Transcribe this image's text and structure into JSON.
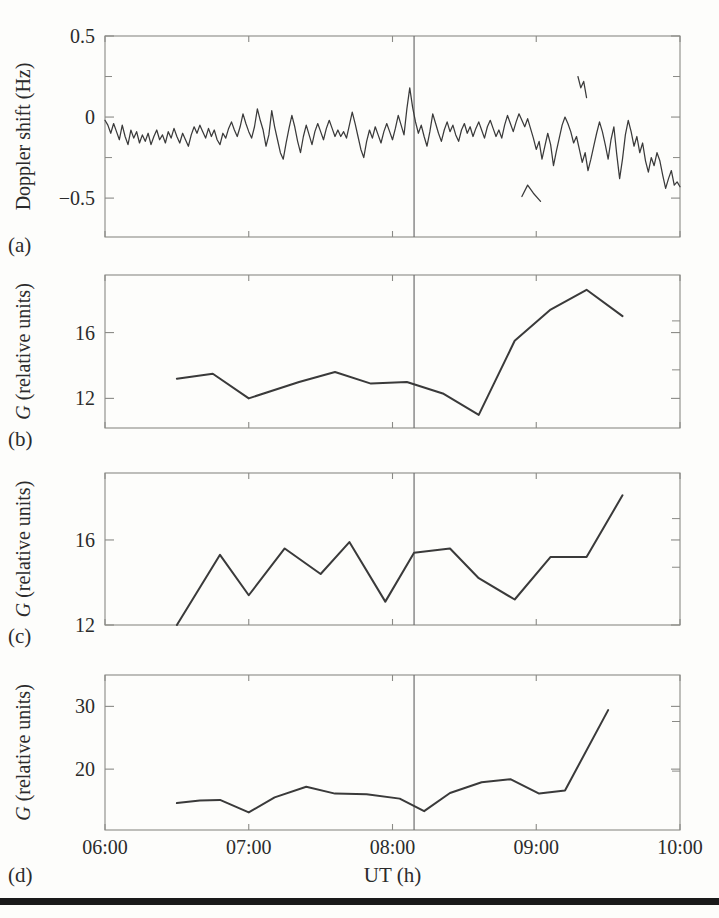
{
  "figure": {
    "panel_labels": [
      "(a)",
      "(b)",
      "(c)",
      "(d)"
    ],
    "xlabel": "UT (h)",
    "xticklabels": [
      "06:00",
      "07:00",
      "08:00",
      "09:00",
      "10:00"
    ],
    "event_marker_label": "08:09",
    "line_color": "#3a3a3a",
    "axis_color": "#8a8a86",
    "marker_color": "#6e6e6e",
    "rule_color": "#1a1a1a"
  },
  "chart_data": [
    {
      "id": "panel-a",
      "panel": "(a)",
      "type": "line",
      "title": "",
      "xlabel": "",
      "ylabel": "Doppler shift (Hz)",
      "xlim": [
        6.0,
        10.0
      ],
      "ylim": [
        -0.74,
        0.5
      ],
      "yticks": [
        0.5,
        0,
        -0.5
      ],
      "yticklabels": [
        "0.5",
        "0",
        "−0.5"
      ],
      "minor_yticks": [
        0.25,
        -0.25
      ],
      "xticks": [
        6,
        7,
        8,
        9,
        10
      ],
      "grid": false,
      "vline": 8.15,
      "series": [
        {
          "name": "doppler-main",
          "x": [
            6.0,
            6.02,
            6.04,
            6.06,
            6.08,
            6.1,
            6.12,
            6.14,
            6.16,
            6.18,
            6.2,
            6.22,
            6.24,
            6.26,
            6.28,
            6.3,
            6.32,
            6.34,
            6.36,
            6.38,
            6.4,
            6.42,
            6.44,
            6.46,
            6.48,
            6.5,
            6.52,
            6.54,
            6.56,
            6.58,
            6.6,
            6.62,
            6.64,
            6.66,
            6.68,
            6.7,
            6.72,
            6.74,
            6.76,
            6.78,
            6.8,
            6.82,
            6.84,
            6.86,
            6.88,
            6.9,
            6.92,
            6.94,
            6.96,
            6.98,
            7.0,
            7.02,
            7.04,
            7.06,
            7.08,
            7.1,
            7.12,
            7.14,
            7.16,
            7.18,
            7.2,
            7.22,
            7.24,
            7.26,
            7.28,
            7.3,
            7.32,
            7.34,
            7.36,
            7.38,
            7.4,
            7.42,
            7.44,
            7.46,
            7.48,
            7.5,
            7.52,
            7.54,
            7.56,
            7.58,
            7.6,
            7.62,
            7.64,
            7.66,
            7.68,
            7.7,
            7.72,
            7.74,
            7.76,
            7.78,
            7.8,
            7.82,
            7.84,
            7.86,
            7.88,
            7.9,
            7.92,
            7.94,
            7.96,
            7.98,
            8.0,
            8.02,
            8.04,
            8.06,
            8.08,
            8.1,
            8.12,
            8.14,
            8.16,
            8.18,
            8.2,
            8.22,
            8.24,
            8.26,
            8.28,
            8.3,
            8.32,
            8.34,
            8.36,
            8.38,
            8.4,
            8.42,
            8.44,
            8.46,
            8.48,
            8.5,
            8.52,
            8.54,
            8.56,
            8.58,
            8.6,
            8.62,
            8.64,
            8.66,
            8.68,
            8.7,
            8.72,
            8.74,
            8.76,
            8.78,
            8.8,
            8.82,
            8.84,
            8.86,
            8.88,
            8.9,
            8.92,
            8.94,
            8.96,
            8.98,
            9.0,
            9.02,
            9.04,
            9.06,
            9.08,
            9.1,
            9.12,
            9.14,
            9.16,
            9.18,
            9.2,
            9.22,
            9.24,
            9.26,
            9.28,
            9.3,
            9.32,
            9.34,
            9.36,
            9.38,
            9.4,
            9.42,
            9.44,
            9.46,
            9.48,
            9.5,
            9.52,
            9.54,
            9.56,
            9.58,
            9.6,
            9.62,
            9.64,
            9.66,
            9.68,
            9.7,
            9.72,
            9.74,
            9.76,
            9.78,
            9.8,
            9.82,
            9.84,
            9.86,
            9.88,
            9.9,
            9.92,
            9.94,
            9.96,
            9.98,
            10.0
          ],
          "y": [
            -0.02,
            -0.05,
            -0.1,
            -0.04,
            -0.09,
            -0.14,
            -0.05,
            -0.12,
            -0.17,
            -0.08,
            -0.13,
            -0.09,
            -0.16,
            -0.11,
            -0.15,
            -0.1,
            -0.17,
            -0.12,
            -0.08,
            -0.14,
            -0.11,
            -0.16,
            -0.09,
            -0.13,
            -0.07,
            -0.12,
            -0.16,
            -0.1,
            -0.14,
            -0.18,
            -0.11,
            -0.06,
            -0.1,
            -0.05,
            -0.09,
            -0.13,
            -0.07,
            -0.12,
            -0.08,
            -0.14,
            -0.17,
            -0.1,
            -0.13,
            -0.07,
            -0.03,
            -0.08,
            -0.12,
            -0.06,
            0.02,
            -0.04,
            -0.09,
            -0.13,
            -0.06,
            0.05,
            -0.02,
            -0.08,
            -0.18,
            -0.11,
            0.04,
            -0.06,
            -0.14,
            -0.22,
            -0.26,
            -0.16,
            -0.07,
            0.01,
            -0.06,
            -0.15,
            -0.22,
            -0.12,
            -0.05,
            -0.11,
            -0.17,
            -0.09,
            -0.04,
            -0.09,
            -0.14,
            -0.07,
            -0.02,
            -0.07,
            -0.12,
            -0.08,
            -0.12,
            -0.09,
            -0.13,
            -0.05,
            0.03,
            -0.04,
            -0.12,
            -0.2,
            -0.25,
            -0.15,
            -0.08,
            -0.13,
            -0.06,
            -0.11,
            -0.16,
            -0.09,
            -0.04,
            -0.09,
            -0.14,
            -0.07,
            0.01,
            -0.05,
            -0.11,
            0.05,
            0.18,
            0.06,
            -0.03,
            -0.1,
            -0.05,
            -0.12,
            -0.18,
            -0.09,
            0.02,
            -0.04,
            -0.1,
            -0.15,
            -0.08,
            -0.03,
            -0.09,
            -0.05,
            -0.11,
            -0.15,
            -0.08,
            -0.04,
            -0.1,
            -0.06,
            -0.12,
            -0.07,
            -0.03,
            -0.08,
            -0.13,
            -0.06,
            -0.02,
            -0.07,
            -0.12,
            -0.08,
            -0.13,
            -0.05,
            0.01,
            -0.04,
            -0.09,
            -0.03,
            0.02,
            -0.02,
            -0.06,
            -0.01,
            -0.07,
            -0.13,
            -0.2,
            -0.15,
            -0.26,
            -0.18,
            -0.1,
            -0.17,
            -0.3,
            -0.21,
            -0.13,
            -0.05,
            0.0,
            -0.04,
            -0.09,
            -0.16,
            -0.12,
            -0.2,
            -0.28,
            -0.22,
            -0.33,
            -0.26,
            -0.18,
            -0.1,
            -0.03,
            -0.09,
            -0.17,
            -0.26,
            -0.14,
            -0.06,
            -0.23,
            -0.38,
            -0.26,
            -0.11,
            -0.02,
            -0.09,
            -0.18,
            -0.12,
            -0.22,
            -0.16,
            -0.27,
            -0.34,
            -0.25,
            -0.3,
            -0.22,
            -0.27,
            -0.36,
            -0.44,
            -0.38,
            -0.33,
            -0.42,
            -0.4,
            -0.43,
            -0.52,
            -0.5,
            -0.48,
            -0.55,
            -0.62,
            -0.58,
            -0.7,
            -0.63,
            -0.6,
            -0.62
          ]
        },
        {
          "name": "doppler-fragment-upper",
          "x": [
            9.29,
            9.31,
            9.33,
            9.35
          ],
          "y": [
            0.25,
            0.18,
            0.22,
            0.12
          ]
        },
        {
          "name": "doppler-fragment-lower",
          "x": [
            8.9,
            8.94,
            8.98,
            9.03
          ],
          "y": [
            -0.49,
            -0.42,
            -0.47,
            -0.52
          ]
        }
      ]
    },
    {
      "id": "panel-b",
      "panel": "(b)",
      "type": "line",
      "title": "",
      "xlabel": "",
      "ylabel": "G (relative units)",
      "xlim": [
        6.0,
        10.0
      ],
      "ylim": [
        10.2,
        19.5
      ],
      "yticks": [
        16,
        12
      ],
      "yticklabels": [
        "16",
        "12"
      ],
      "xticks": [
        6,
        7,
        8,
        9,
        10
      ],
      "grid": false,
      "vline": 8.15,
      "series": [
        {
          "name": "G-panel-b",
          "x": [
            6.5,
            6.75,
            7.0,
            7.35,
            7.6,
            7.85,
            8.1,
            8.35,
            8.6,
            8.85,
            9.1,
            9.35,
            9.6
          ],
          "y": [
            13.2,
            13.5,
            12.0,
            13.0,
            13.6,
            12.9,
            13.0,
            12.3,
            11.0,
            15.5,
            17.4,
            18.6,
            17.0
          ]
        }
      ]
    },
    {
      "id": "panel-c",
      "panel": "(c)",
      "type": "line",
      "title": "",
      "xlabel": "",
      "ylabel": "G (relative units)",
      "xlim": [
        6.0,
        10.0
      ],
      "ylim": [
        12.0,
        19.15
      ],
      "yticks": [
        16,
        12
      ],
      "yticklabels": [
        "16",
        "12"
      ],
      "xticks": [
        6,
        7,
        8,
        9,
        10
      ],
      "grid": false,
      "vline": 8.15,
      "series": [
        {
          "name": "G-panel-c",
          "x": [
            6.5,
            6.8,
            7.0,
            7.25,
            7.5,
            7.7,
            7.95,
            8.15,
            8.4,
            8.6,
            8.85,
            9.1,
            9.35,
            9.6
          ],
          "y": [
            12.0,
            15.3,
            13.4,
            15.6,
            14.4,
            15.9,
            13.1,
            15.4,
            15.6,
            14.2,
            13.2,
            15.2,
            15.2,
            18.1
          ]
        }
      ]
    },
    {
      "id": "panel-d",
      "panel": "(d)",
      "type": "line",
      "title": "",
      "xlabel": "UT (h)",
      "ylabel": "G (relative units)",
      "xlim": [
        6.0,
        10.0
      ],
      "ylim": [
        10.3,
        35.0
      ],
      "yticks": [
        30,
        20
      ],
      "yticklabels": [
        "30",
        "20"
      ],
      "xticks": [
        6,
        7,
        8,
        9,
        10
      ],
      "grid": false,
      "vline": 8.15,
      "series": [
        {
          "name": "G-panel-d",
          "x": [
            6.5,
            6.66,
            6.8,
            7.0,
            7.18,
            7.4,
            7.6,
            7.82,
            8.05,
            8.22,
            8.4,
            8.62,
            8.82,
            9.02,
            9.2,
            9.5
          ],
          "y": [
            14.6,
            15.0,
            15.1,
            13.1,
            15.5,
            17.2,
            16.1,
            16.0,
            15.3,
            13.3,
            16.2,
            17.9,
            18.4,
            16.1,
            16.6,
            29.4
          ]
        }
      ]
    }
  ]
}
